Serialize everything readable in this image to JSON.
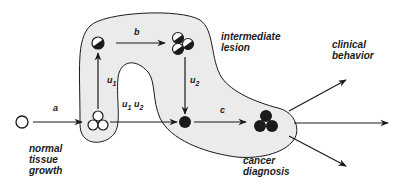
{
  "figure": {
    "colors": {
      "region_fill": "#ebebeb",
      "stroke": "#1a1a1a",
      "background": "#ffffff"
    },
    "stage_labels": {
      "normal": "normal\ntissue\ngrowth",
      "intermediate": "intermediate\nlesion",
      "clinical": "clinical\nbehavior",
      "cancer": "cancer\ndiagnosis"
    },
    "transitions": {
      "a": "a",
      "b": "b",
      "c": "c",
      "u1_label": "u",
      "u1_sub": "1",
      "u2_label": "u",
      "u2_sub": "2",
      "u1u2_u1": "u",
      "u1u2_sub1": "1",
      "u1u2_u2": "u",
      "u1u2_sub2": "2"
    },
    "nodes": [
      {
        "id": "normal-cell",
        "type": "open-circle"
      },
      {
        "id": "normal-cluster",
        "type": "three-open-circles"
      },
      {
        "id": "initiated-cell",
        "type": "half-filled-circle"
      },
      {
        "id": "intermediate-cluster",
        "type": "three-half-filled-circles"
      },
      {
        "id": "malignant-cell",
        "type": "filled-circle"
      },
      {
        "id": "cancer-cluster",
        "type": "three-filled-circles"
      }
    ],
    "outcome_arrows": 3
  }
}
